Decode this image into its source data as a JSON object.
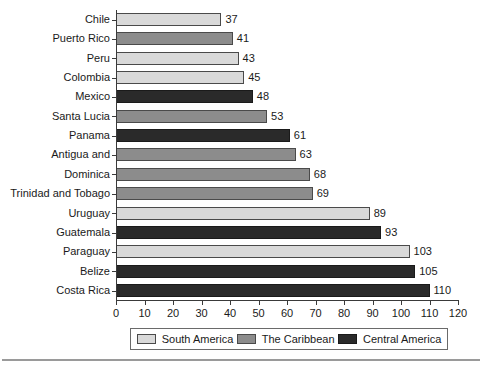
{
  "chart_data": {
    "type": "bar",
    "orientation": "horizontal",
    "title": "",
    "xlabel": "",
    "ylabel": "",
    "xlim": [
      0,
      120
    ],
    "xticks": [
      0,
      10,
      20,
      30,
      40,
      50,
      60,
      70,
      80,
      90,
      100,
      110,
      120
    ],
    "grid": false,
    "legend_position": "bottom",
    "categories": [
      "Chile",
      "Puerto Rico",
      "Peru",
      "Colombia",
      "Mexico",
      "Santa Lucia",
      "Panama",
      "Antigua and",
      "Dominica",
      "Trinidad and Tobago",
      "Uruguay",
      "Guatemala",
      "Paraguay",
      "Belize",
      "Costa Rica"
    ],
    "values": [
      37,
      41,
      43,
      45,
      48,
      53,
      61,
      63,
      68,
      69,
      89,
      93,
      103,
      105,
      110
    ],
    "groups": [
      "South America",
      "The Caribbean",
      "South America",
      "South America",
      "Central America",
      "The Caribbean",
      "Central America",
      "The Caribbean",
      "The Caribbean",
      "The Caribbean",
      "South America",
      "Central America",
      "South America",
      "Central America",
      "Central America"
    ],
    "series": [
      {
        "name": "South America",
        "color": "#d9d9d9",
        "points": [
          {
            "category": "Chile",
            "value": 37
          },
          {
            "category": "Peru",
            "value": 43
          },
          {
            "category": "Colombia",
            "value": 45
          },
          {
            "category": "Uruguay",
            "value": 89
          },
          {
            "category": "Paraguay",
            "value": 103
          }
        ]
      },
      {
        "name": "The Caribbean",
        "color": "#8c8c8c",
        "points": [
          {
            "category": "Puerto Rico",
            "value": 41
          },
          {
            "category": "Santa Lucia",
            "value": 53
          },
          {
            "category": "Antigua and",
            "value": 63
          },
          {
            "category": "Dominica",
            "value": 68
          },
          {
            "category": "Trinidad and Tobago",
            "value": 69
          }
        ]
      },
      {
        "name": "Central America",
        "color": "#2a2a2a",
        "points": [
          {
            "category": "Mexico",
            "value": 48
          },
          {
            "category": "Panama",
            "value": 61
          },
          {
            "category": "Guatemala",
            "value": 93
          },
          {
            "category": "Belize",
            "value": 105
          },
          {
            "category": "Costa Rica",
            "value": 110
          }
        ]
      }
    ],
    "legend": [
      {
        "label": "South America",
        "color": "#d9d9d9",
        "key": "south"
      },
      {
        "label": "The Caribbean",
        "color": "#8c8c8c",
        "key": "carib"
      },
      {
        "label": "Central America",
        "color": "#2a2a2a",
        "key": "central"
      }
    ]
  }
}
